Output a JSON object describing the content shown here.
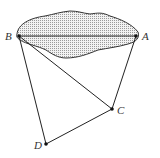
{
  "diagram": {
    "type": "geometry",
    "shaded_region": {
      "description": "irregular shaded region (lake/pond) containing segment AB"
    },
    "points": [
      {
        "name": "A",
        "x": 136,
        "y": 36,
        "label_x": 142,
        "label_y": 40
      },
      {
        "name": "B",
        "x": 19,
        "y": 36,
        "label_x": 5,
        "label_y": 40
      },
      {
        "name": "C",
        "x": 112,
        "y": 109,
        "label_x": 117,
        "label_y": 114
      },
      {
        "name": "D",
        "x": 46,
        "y": 144,
        "label_x": 34,
        "label_y": 149
      }
    ],
    "segments": [
      [
        "B",
        "A"
      ],
      [
        "B",
        "D"
      ],
      [
        "A",
        "C"
      ],
      [
        "B",
        "C"
      ],
      [
        "C",
        "D"
      ]
    ],
    "labels": {
      "A": "A",
      "B": "B",
      "C": "C",
      "D": "D"
    }
  }
}
